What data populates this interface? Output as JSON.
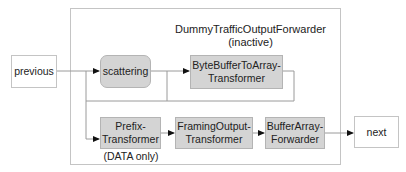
{
  "diagram": {
    "container": {
      "title": "DummyTrafficOutputForwarder",
      "subtitle": "(inactive)"
    },
    "nodes": {
      "previous": {
        "label": "previous"
      },
      "scattering": {
        "label": "scattering"
      },
      "byte_buffer": {
        "line1": "ByteBufferToArray-",
        "line2": "Transformer"
      },
      "prefix": {
        "line1": "Prefix-",
        "line2": "Transformer",
        "caption": "(DATA only)"
      },
      "framing": {
        "line1": "FramingOutput-",
        "line2": "Transformer"
      },
      "buffer_array": {
        "line1": "BufferArray-",
        "line2": "Forwarder"
      },
      "next": {
        "label": "next"
      }
    },
    "colors": {
      "border": "#c4c4c4",
      "node_fill": "#d4d4d4",
      "line": "#9a9a9a",
      "arrow": "#111111"
    }
  }
}
